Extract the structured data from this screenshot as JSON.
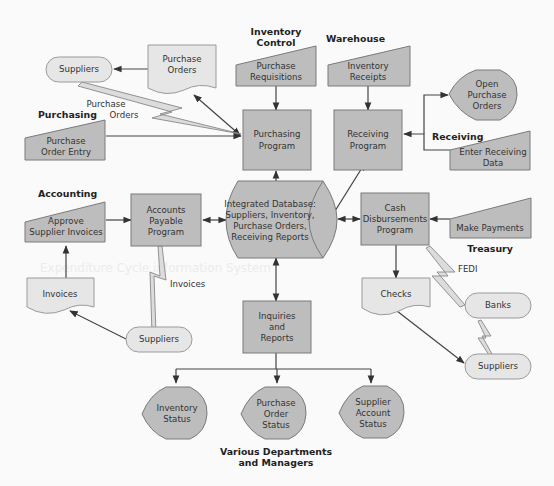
{
  "diagram": {
    "title": "Expenditure Cycle information System",
    "background_text": [
      "Expenditure Cycle information System"
    ],
    "groups": {
      "inventory_control": [
        "Inventory",
        "Control"
      ],
      "warehouse": [
        "Warehouse"
      ],
      "purchasing": [
        "Purchasing"
      ],
      "receiving": [
        "Receiving"
      ],
      "accounting": [
        "Accounting"
      ],
      "treasury": [
        "Treasury"
      ],
      "various": [
        "Various Departments",
        "and Managers"
      ]
    },
    "nodes": {
      "suppliers_top": [
        "Suppliers"
      ],
      "purchase_orders_doc": [
        "Purchase",
        "Orders"
      ],
      "purchase_requisitions": [
        "Purchase",
        "Requisitions"
      ],
      "inventory_receipts": [
        "Inventory",
        "Receipts"
      ],
      "open_purchase_orders": [
        "Open",
        "Purchase",
        "Orders"
      ],
      "purchase_order_entry": [
        "Purchase",
        "Order Entry"
      ],
      "purchasing_program": [
        "Purchasing",
        "Program"
      ],
      "receiving_program": [
        "Receiving",
        "Program"
      ],
      "enter_receiving_data": [
        "Enter Receiving",
        "Data"
      ],
      "approve_supplier_invoices": [
        "Approve",
        "Supplier Invoices"
      ],
      "accounts_payable_program": [
        "Accounts",
        "Payable",
        "Program"
      ],
      "integrated_database": [
        "Integrated Database:",
        "Suppliers, Inventory,",
        "Purchase Orders,",
        "Receiving Reports"
      ],
      "cash_disbursements_program": [
        "Cash",
        "Disbursements",
        "Program"
      ],
      "make_payments": [
        "Make Payments"
      ],
      "invoices_doc": [
        "Invoices"
      ],
      "checks_doc": [
        "Checks"
      ],
      "banks": [
        "Banks"
      ],
      "suppliers_left": [
        "Suppliers"
      ],
      "suppliers_right": [
        "Suppliers"
      ],
      "inquiries_reports": [
        "Inquiries",
        "and",
        "Reports"
      ],
      "inventory_status": [
        "Inventory",
        "Status"
      ],
      "purchase_order_status": [
        "Purchase",
        "Order",
        "Status"
      ],
      "supplier_account_status": [
        "Supplier",
        "Account",
        "Status"
      ]
    },
    "edge_labels": {
      "purchase_orders_link": [
        "Purchase",
        "Orders"
      ],
      "invoices_link": [
        "Invoices"
      ],
      "fedi_link": [
        "FEDI"
      ]
    },
    "colors": {
      "process_fill": "#bdbdbd",
      "document_fill": "#e6e6e6",
      "stroke": "#7a7a7a",
      "background": "#fafafa"
    }
  }
}
